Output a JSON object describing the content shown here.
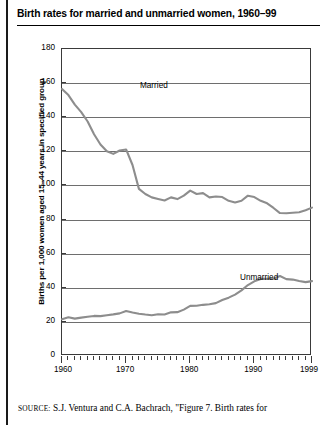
{
  "figure": {
    "title": "Birth rates for married and unmarried women, 1960–99",
    "source_prefix": "SOURCE:",
    "source_text": "S.J. Ventura and C.A. Bachrach, \"Figure 7. Birth rates for"
  },
  "chart_data": {
    "type": "line",
    "title": "Birth rates for married and unmarried women, 1960–99",
    "xlabel": "",
    "ylabel": "Births per 1,000 women aged 15–44 years in specified group",
    "xlim": [
      1960,
      1999
    ],
    "ylim": [
      0,
      180
    ],
    "ytick_labels": [
      "0",
      "20",
      "40",
      "60",
      "80",
      "100",
      "120",
      "140",
      "160",
      "180"
    ],
    "ytick_values": [
      0,
      20,
      40,
      60,
      80,
      100,
      120,
      140,
      160,
      180
    ],
    "xtick_labels": [
      "1960",
      "1970",
      "1980",
      "1990",
      "1999"
    ],
    "xtick_values": [
      1960,
      1970,
      1980,
      1990,
      1999
    ],
    "grid": "horizontal",
    "legend_position": "inline-annotations",
    "series_color": "#8d8d8d",
    "x": [
      1960,
      1961,
      1962,
      1963,
      1964,
      1965,
      1966,
      1967,
      1968,
      1969,
      1970,
      1971,
      1972,
      1973,
      1974,
      1975,
      1976,
      1977,
      1978,
      1979,
      1980,
      1981,
      1982,
      1983,
      1984,
      1985,
      1986,
      1987,
      1988,
      1989,
      1990,
      1991,
      1992,
      1993,
      1994,
      1995,
      1996,
      1997,
      1998,
      1999
    ],
    "series": [
      {
        "name": "Married",
        "label": "Married",
        "values": [
          156.6,
          153.0,
          147.4,
          143.0,
          137.5,
          130.0,
          124.0,
          120.0,
          118.5,
          120.5,
          121.1,
          112.0,
          98.0,
          95.0,
          93.0,
          92.1,
          91.2,
          93.0,
          92.0,
          94.0,
          97.0,
          95.0,
          95.5,
          93.0,
          93.5,
          93.2,
          91.0,
          90.0,
          91.0,
          94.0,
          93.2,
          91.0,
          89.5,
          86.8,
          83.8,
          83.7,
          84.0,
          84.3,
          85.5,
          87.0
        ]
      },
      {
        "name": "Unmarried",
        "label": "Unmarried",
        "values": [
          21.6,
          22.7,
          21.9,
          22.5,
          23.0,
          23.5,
          23.4,
          23.9,
          24.4,
          25.0,
          26.4,
          25.5,
          24.8,
          24.3,
          23.9,
          24.5,
          24.3,
          25.6,
          25.7,
          27.2,
          29.4,
          29.5,
          30.0,
          30.3,
          31.0,
          32.8,
          34.2,
          36.0,
          38.5,
          41.6,
          43.8,
          45.2,
          45.2,
          45.3,
          46.9,
          45.1,
          44.8,
          44.0,
          43.3,
          43.9
        ]
      }
    ],
    "annotations": [
      {
        "text": "Married",
        "x_px": 78,
        "y_px": 32
      },
      {
        "text": "Unmarried",
        "x_px": 178,
        "y_px": 224
      }
    ]
  }
}
